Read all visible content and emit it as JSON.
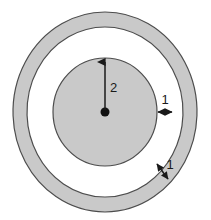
{
  "figure": {
    "background_color": "#ffffff",
    "fill_color": "#c9c9c9",
    "stroke_color": "#4d4d4d",
    "annotation_color": "#1a1a1a",
    "center": {
      "x": 105,
      "y": 112
    },
    "shapes": {
      "outer_ring": {
        "name": "outer-annulus",
        "outer_rx": 92,
        "outer_ry": 100,
        "inner_rx": 78,
        "inner_ry": 85,
        "filled": true
      },
      "white_gap": {
        "name": "white-annulus-gap",
        "outer_rx": 78,
        "outer_ry": 85,
        "inner_rx": 52,
        "inner_ry": 54,
        "filled": false
      },
      "inner_disc": {
        "name": "inner-disc",
        "rx": 52,
        "ry": 54,
        "filled": true
      },
      "center_dot": {
        "name": "center-point",
        "r": 4.5
      }
    },
    "annotations": [
      {
        "id": "radius-dimension",
        "label": "2",
        "kind": "arrow-single",
        "measures": "inner disc radius",
        "label_x": 110,
        "label_y": 92,
        "from_x": 105,
        "from_y": 110,
        "to_x": 105,
        "to_y": 59
      },
      {
        "id": "gap-dimension",
        "label": "1",
        "kind": "arrow-double",
        "measures": "white gap width",
        "label_x": 165,
        "label_y": 103,
        "from_x": 157,
        "from_y": 112,
        "to_x": 173,
        "to_y": 112
      },
      {
        "id": "band-dimension",
        "label": "1",
        "kind": "arrow-double",
        "measures": "outer ring band thickness",
        "label_x": 170,
        "label_y": 168,
        "from_x": 156,
        "from_y": 162,
        "to_x": 169,
        "to_y": 181
      }
    ]
  }
}
